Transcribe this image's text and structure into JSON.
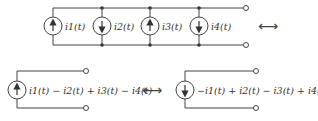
{
  "top_circuit": {
    "sources": [
      {
        "label": "i1(t)",
        "direction": "up"
      },
      {
        "label": "i2(t)",
        "direction": "down"
      },
      {
        "label": "i3(t)",
        "direction": "up"
      },
      {
        "label": "i4(t)",
        "direction": "down"
      }
    ]
  },
  "equivalence_symbol": "⟷",
  "bottom_left": {
    "label": "i1(t) − i2(t) + i3(t) − i4(t)",
    "direction": "up"
  },
  "bottom_right": {
    "label": "−i1(t) + i2(t) − i3(t) + i4(t)",
    "direction": "down"
  }
}
